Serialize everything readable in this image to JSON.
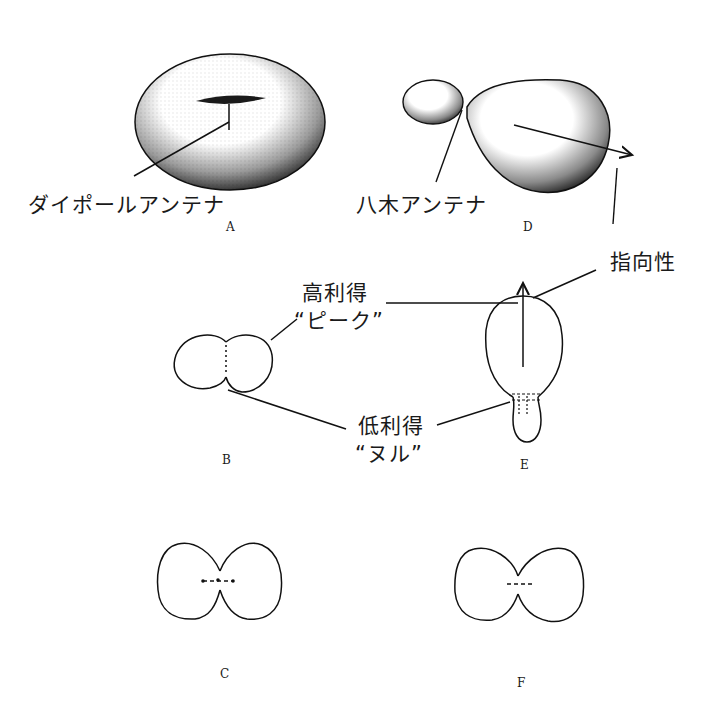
{
  "figures": {
    "A": {
      "letter": "A",
      "label": "ダイポールアンテナ"
    },
    "B": {
      "letter": "B"
    },
    "C": {
      "letter": "C"
    },
    "D": {
      "letter": "D",
      "label": "八木アンテナ"
    },
    "E": {
      "letter": "E"
    },
    "F": {
      "letter": "F"
    }
  },
  "annotations": {
    "directivity": "指向性",
    "high_gain": "高利得",
    "peak": "“ピーク”",
    "low_gain": "低利得",
    "null": "“ヌル”"
  }
}
